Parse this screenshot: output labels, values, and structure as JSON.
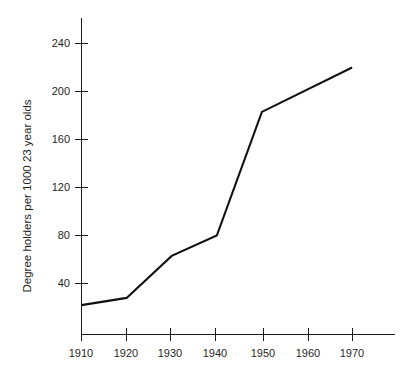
{
  "chart_data": {
    "type": "line",
    "title": "",
    "subtitle": "",
    "xlabel": "",
    "ylabel": "Degree holders per 1000 23 year olds",
    "x": [
      1910,
      1920,
      1930,
      1940,
      1950,
      1970
    ],
    "values": [
      22,
      28,
      63,
      80,
      183,
      220
    ],
    "series": [
      {
        "name": "Degree holders per 1000 23 year olds",
        "x": [
          1910,
          1920,
          1930,
          1940,
          1950,
          1970
        ],
        "values": [
          22,
          28,
          63,
          80,
          183,
          220
        ]
      }
    ],
    "x_tick_labels": [
      "1910",
      "1920",
      "1930",
      "1940",
      "1950",
      "1960",
      "1970"
    ],
    "x_ticks": [
      1910,
      1920,
      1930,
      1940,
      1950,
      1960,
      1970
    ],
    "y_tick_labels": [
      "40",
      "80",
      "120",
      "160",
      "200",
      "240"
    ],
    "y_ticks": [
      40,
      80,
      120,
      160,
      200,
      240
    ],
    "xlim": [
      1910,
      1980
    ],
    "ylim": [
      0,
      265
    ],
    "grid": false,
    "legend": false,
    "legend_position": "none",
    "annotations": [],
    "line_color": "#111111",
    "axis_color": "#1a1a1a",
    "background_color": "#ffffff"
  }
}
